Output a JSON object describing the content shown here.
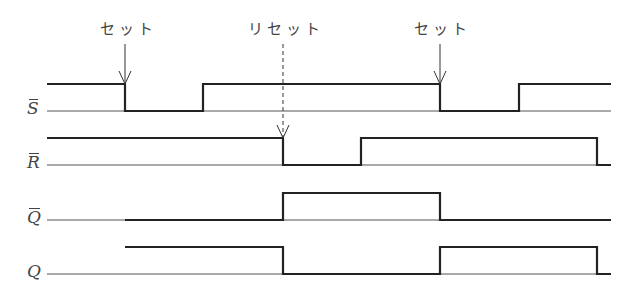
{
  "annotations": [
    {
      "id": "set-1",
      "text": "セット",
      "x": 125
    },
    {
      "id": "reset",
      "text": "リセット",
      "x": 283
    },
    {
      "id": "set-2",
      "text": "セット",
      "x": 440
    }
  ],
  "signals": [
    {
      "name": "S",
      "label": "S",
      "overbar": true
    },
    {
      "name": "R",
      "label": "R",
      "overbar": true
    },
    {
      "name": "Q_bar",
      "label": "Q",
      "overbar": true
    },
    {
      "name": "Q",
      "label": "Q",
      "overbar": false
    }
  ],
  "timing": {
    "x_start": 47,
    "x_end": 611,
    "S_bar": [
      [
        47,
        1
      ],
      [
        125,
        0
      ],
      [
        203,
        1
      ],
      [
        440,
        0
      ],
      [
        519,
        1
      ],
      [
        611,
        1
      ]
    ],
    "R_bar": [
      [
        47,
        1
      ],
      [
        283,
        0
      ],
      [
        361,
        1
      ],
      [
        597,
        0
      ],
      [
        611,
        0
      ]
    ],
    "Q_bar": [
      [
        125,
        0
      ],
      [
        283,
        1
      ],
      [
        440,
        0
      ],
      [
        611,
        0
      ]
    ],
    "Q": [
      [
        125,
        1
      ],
      [
        283,
        0
      ],
      [
        440,
        1
      ],
      [
        597,
        0
      ],
      [
        611,
        0
      ]
    ]
  },
  "colors": {
    "line": "#222222",
    "background": "#ffffff"
  }
}
